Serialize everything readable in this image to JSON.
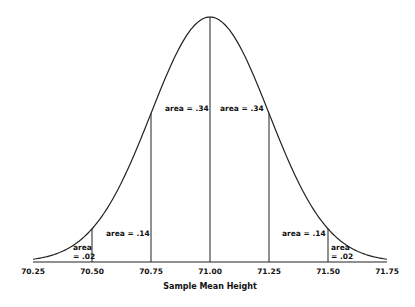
{
  "chart_data": {
    "type": "line",
    "title": "",
    "subtitle": "Normal sampling distribution of sample mean height (mean 71.00, SD 0.25)",
    "xlabel": "Sample Mean Height",
    "ylabel": "",
    "xlim": [
      70.25,
      71.75
    ],
    "mean": 71.0,
    "sd": 0.25,
    "x_ticks": [
      "70.25",
      "70.50",
      "70.75",
      "71.00",
      "71.25",
      "71.50",
      "71.75"
    ],
    "x_tick_values": [
      70.25,
      70.5,
      70.75,
      71.0,
      71.25,
      71.5,
      71.75
    ],
    "dividers": [
      70.5,
      70.75,
      71.0,
      71.25,
      71.5
    ],
    "regions": [
      {
        "from": 70.25,
        "to": 70.5,
        "label_line1": "area",
        "label_line2": "= .02",
        "area": 0.02
      },
      {
        "from": 70.5,
        "to": 70.75,
        "label": "area = .14",
        "area": 0.14
      },
      {
        "from": 70.75,
        "to": 71.0,
        "label": "area = .34",
        "area": 0.34
      },
      {
        "from": 71.0,
        "to": 71.25,
        "label": "area = .34",
        "area": 0.34
      },
      {
        "from": 71.25,
        "to": 71.5,
        "label": "area = .14",
        "area": 0.14
      },
      {
        "from": 71.5,
        "to": 71.75,
        "label_line1": "area",
        "label_line2": "= .02",
        "area": 0.02
      }
    ],
    "grid": false,
    "legend": "none",
    "colors": {
      "line": "#222222",
      "text": "#111111",
      "background": "#ffffff"
    }
  }
}
